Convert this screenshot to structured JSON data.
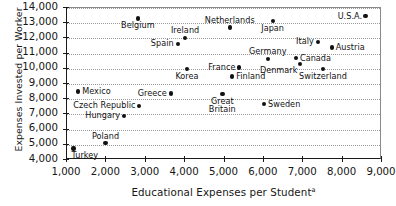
{
  "chart_data": {
    "type": "scatter",
    "title": "",
    "xlabel": "Educational Expenses per Student",
    "xlabel_superscript": "a",
    "ylabel": "Expenses Invested per Worker",
    "xlim": [
      600,
      9000
    ],
    "ylim": [
      4000,
      14000
    ],
    "xticks": [
      1000,
      2000,
      3000,
      4000,
      5000,
      6000,
      7000,
      8000,
      9000
    ],
    "xtick_labels": [
      "1,000",
      "2,000",
      "3,000",
      "4,000",
      "5,000",
      "6,000",
      "7,000",
      "8,000",
      "9,000"
    ],
    "yticks": [
      4000,
      5000,
      6000,
      7000,
      8000,
      9000,
      10000,
      11000,
      12000,
      13000,
      14000
    ],
    "ytick_labels": [
      "4,000",
      "5,000",
      "6,000",
      "7,000",
      "8,000",
      "9,000",
      "10,000",
      "11,000",
      "12,000",
      "13,000",
      "14,000"
    ],
    "grid": "horizontal-dotted",
    "legend": "none",
    "points": [
      {
        "name": "Belgium",
        "x": 2830,
        "y": 13250,
        "label_pos": "below"
      },
      {
        "name": "Netherlands",
        "x": 5160,
        "y": 12660,
        "label_pos": "above"
      },
      {
        "name": "Ireland",
        "x": 4020,
        "y": 11980,
        "label_pos": "above"
      },
      {
        "name": "Spain",
        "x": 3840,
        "y": 11570,
        "label_pos": "left"
      },
      {
        "name": "Japan",
        "x": 6250,
        "y": 13080,
        "label_pos": "below"
      },
      {
        "name": "U.S.A.",
        "x": 8610,
        "y": 13400,
        "label_pos": "left"
      },
      {
        "name": "Italy",
        "x": 7400,
        "y": 11710,
        "label_pos": "left"
      },
      {
        "name": "Austria",
        "x": 7750,
        "y": 11340,
        "label_pos": "right"
      },
      {
        "name": "Germany",
        "x": 6130,
        "y": 10580,
        "label_pos": "above"
      },
      {
        "name": "Canada",
        "x": 6840,
        "y": 10640,
        "label_pos": "right"
      },
      {
        "name": "France",
        "x": 5400,
        "y": 10020,
        "label_pos": "left"
      },
      {
        "name": "Denmark",
        "x": 6940,
        "y": 10230,
        "label_pos": "below-left"
      },
      {
        "name": "Switzerland",
        "x": 7530,
        "y": 9940,
        "label_pos": "below"
      },
      {
        "name": "Korea",
        "x": 4070,
        "y": 9920,
        "label_pos": "below"
      },
      {
        "name": "Finland",
        "x": 5220,
        "y": 9420,
        "label_pos": "right"
      },
      {
        "name": "Greece",
        "x": 3660,
        "y": 8300,
        "label_pos": "left"
      },
      {
        "name": "Mexico",
        "x": 1310,
        "y": 8430,
        "label_pos": "right"
      },
      {
        "name": "Great Britain",
        "x": 4970,
        "y": 8270,
        "label_pos": "below-2line"
      },
      {
        "name": "Sweden",
        "x": 6030,
        "y": 7600,
        "label_pos": "right"
      },
      {
        "name": "Czech Republic",
        "x": 2860,
        "y": 7500,
        "label_pos": "left"
      },
      {
        "name": "Hungary",
        "x": 2480,
        "y": 6830,
        "label_pos": "left"
      },
      {
        "name": "Poland",
        "x": 2000,
        "y": 5050,
        "label_pos": "above"
      },
      {
        "name": "Turkey",
        "x": 1190,
        "y": 4700,
        "label_pos": "below-right"
      }
    ]
  }
}
